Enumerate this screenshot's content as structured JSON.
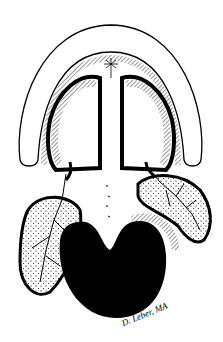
{
  "illustration": {
    "subject": "anatomical line drawing",
    "style": "black ink on white",
    "colors": {
      "ink": "#000000",
      "paper": "#ffffff"
    }
  },
  "signature": "D. Leber, MA"
}
